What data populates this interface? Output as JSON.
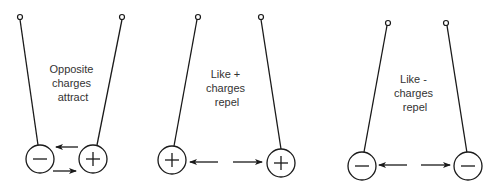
{
  "panels": [
    {
      "id": "opposite",
      "label_lines": [
        "Opposite",
        "charges",
        "attract"
      ],
      "left_charge": "-",
      "right_charge": "+",
      "interaction": "attract"
    },
    {
      "id": "like-positive",
      "label_lines": [
        "Like +",
        "charges",
        "repel"
      ],
      "left_charge": "+",
      "right_charge": "+",
      "interaction": "repel"
    },
    {
      "id": "like-negative",
      "label_lines": [
        "Like -",
        "charges",
        "repel"
      ],
      "left_charge": "-",
      "right_charge": "-",
      "interaction": "repel"
    }
  ]
}
